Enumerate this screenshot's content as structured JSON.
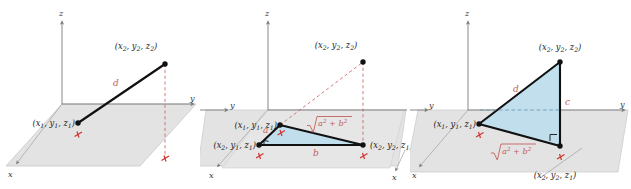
{
  "figure": {
    "background_color": "#ffffff",
    "panel_count": 3
  },
  "style_colors": {
    "plane_fill": "#e3e3e3",
    "plane_edge": "#b9b9b9",
    "triangle_fill": "#bfdded",
    "triangle_edge": "#111111",
    "axis_color": "#7a7a7a",
    "dashed_red": "#c2605c",
    "label_red": "#c2605c",
    "label_black": "#1b1b1b",
    "tick_red": "#d0352f"
  },
  "axes": {
    "x_label": "x",
    "y_label": "y",
    "z_label": "z"
  },
  "points": {
    "p1": {
      "full": "(x₁, y₁, z₁)",
      "x": "x",
      "x_sub": "1",
      "y": "y",
      "y_sub": "1",
      "z": "z",
      "z_sub": "1"
    },
    "p2": {
      "full": "(x₂, y₂, z₂)",
      "x": "x",
      "x_sub": "2",
      "y": "y",
      "y_sub": "2",
      "z": "z",
      "z_sub": "2"
    },
    "p_xy1": {
      "full": "(x₂, y₁, z₁)"
    },
    "p_xy2": {
      "full": "(x₂, y₂, z₁)"
    }
  },
  "panels": [
    {
      "id": "panel-left",
      "name": "distance-d-panel",
      "index": 1,
      "description": "Segment d drawn between P1 and P2 in 3-space",
      "labels": {
        "point_lower": "(x₁, y₁, z₁)",
        "point_upper": "(x₂, y₂, z₂)",
        "segment": "d",
        "axis_x": "x",
        "axis_y": "y",
        "axis_z": "z"
      },
      "tick_marks": 2,
      "has_shaded_triangle": false,
      "dashed_segments": [
        "vertical drop from (x2,y2,z2) to the xy-plane"
      ]
    },
    {
      "id": "panel-middle",
      "name": "legs-a-b-panel",
      "index": 2,
      "description": "Horizontal right triangle with legs a and b and hypotenuse sqrt(a^2+b^2)",
      "labels": {
        "point_upper": "(x₂, y₂, z₂)",
        "point_p1": "(x₁, y₁, z₁)",
        "point_corner": "(x₂, y₁, z₁)",
        "point_foot": "(x₂, y₂, z₁)",
        "leg_a": "a",
        "leg_b": "b",
        "hypotenuse_radicand": "a² + b²",
        "hypotenuse": "√(a² + b²)",
        "axis_x": "x",
        "axis_y": "y",
        "axis_z": "z"
      },
      "tick_marks": 3,
      "has_shaded_triangle": true,
      "has_right_angle_marker": true,
      "dashed_segments": [
        "from (x1,y1,z1) up to (x2,y2,z2)",
        "vertical drop from (x2,y2,z2) to (x2,y2,z1)"
      ]
    },
    {
      "id": "panel-right",
      "name": "vertical-triangle-panel",
      "index": 3,
      "description": "Vertical right triangle with legs sqrt(a^2+b^2) and c, hypotenuse d",
      "labels": {
        "point_upper": "(x₂, y₂, z₂)",
        "point_p1": "(x₁, y₁, z₁)",
        "point_foot": "(x₂, y₂, z₁)",
        "hypotenuse": "d",
        "vertical_leg": "c",
        "base_radicand": "a² + b²",
        "base_leg": "√(a² + b²)",
        "axis_x": "x",
        "axis_y": "y",
        "axis_z": "z"
      },
      "tick_marks": 2,
      "has_shaded_triangle": true,
      "has_right_angle_marker": true,
      "dashed_segments": [
        "horizontal dashed line from (x1,y1,z1) toward the vertical leg"
      ]
    }
  ]
}
